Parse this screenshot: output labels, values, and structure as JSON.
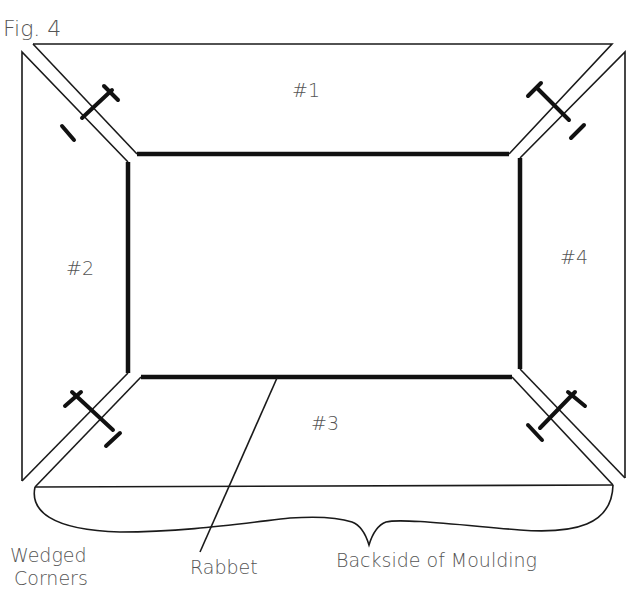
{
  "figure": {
    "title": "Fig. 4"
  },
  "pieces": [
    {
      "id": "top",
      "label": "#1"
    },
    {
      "id": "left",
      "label": "#2"
    },
    {
      "id": "bottom",
      "label": "#3"
    },
    {
      "id": "right",
      "label": "#4"
    }
  ],
  "callouts": {
    "wedged_corners_line1": "Wedged",
    "wedged_corners_line2": "Corners",
    "rabbet": "Rabbet",
    "backside": "Backside of Moulding"
  },
  "colors": {
    "line": "#111111",
    "text": "#555555",
    "background": "#ffffff"
  }
}
